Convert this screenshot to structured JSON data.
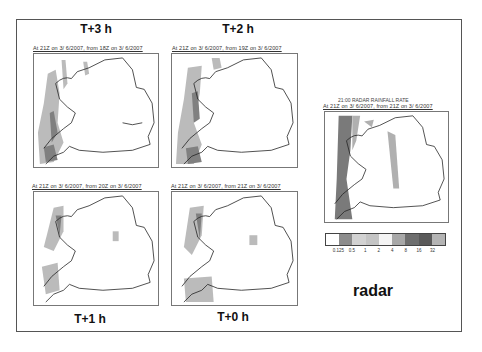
{
  "panels": [
    {
      "id": "t3",
      "title": "T+3 h",
      "caption": "At 21Z on 3/ 6/2007, from 18Z on 3/ 6/2007"
    },
    {
      "id": "t2",
      "title": "T+2 h",
      "caption": "At 21Z on 3/ 6/2007, from 19Z on 3/ 6/2007"
    },
    {
      "id": "t1",
      "title": "T+1 h",
      "caption": "At 21Z on 3/ 6/2007, from 20Z on 3/ 6/2007"
    },
    {
      "id": "t0",
      "title": "T+0 h",
      "caption": "At 21Z on 3/ 6/2007, from 21Z on 3/ 6/2007"
    }
  ],
  "radar": {
    "header": "21:00     RADAR RAINFALL RATE",
    "caption": "At 21Z on 3/ 6/2007, from 21Z on 3/ 6/2007",
    "title": "radar"
  },
  "legend": {
    "colors": [
      "#ffffff",
      "#8c8c8c",
      "#d2d2d2",
      "#c4c4c4",
      "#f4f4f4",
      "#a8a8a8",
      "#6e6e6e",
      "#5a5a5a",
      "#b4b4b4"
    ],
    "ticks": [
      "0.125",
      "0.5",
      "1",
      "2",
      "4",
      "8",
      "16",
      "32"
    ]
  },
  "colors": {
    "rain_light": "#c8c8c8",
    "rain_mid": "#a0a0a0",
    "rain_heavy": "#707070",
    "coast": "#222222"
  }
}
